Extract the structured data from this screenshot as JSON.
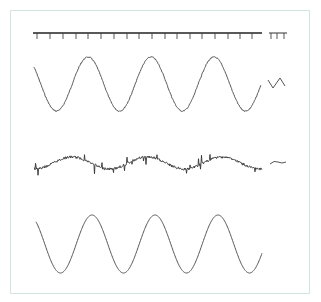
{
  "figure": {
    "border_color": "#cfe6e2",
    "line_color": "#555555",
    "ruler": {
      "y": 33,
      "x_start": 33,
      "x_end": 262,
      "tick_positions": [
        37,
        50,
        63,
        76,
        88,
        101,
        114,
        127,
        139,
        152,
        165,
        177,
        190,
        202,
        215,
        228,
        240,
        252
      ],
      "tick_length": 6,
      "legend_ticks": [
        271,
        277,
        284
      ],
      "legend_x_start": 269,
      "legend_x_end": 287
    },
    "traces": [
      {
        "name": "clean-sine-top",
        "x_start": 34,
        "x_end": 261,
        "center_y": 84,
        "amplitude": 27,
        "period": 63,
        "phase_x": 88,
        "noise": 0.6,
        "legend_glyph": "zigzag"
      },
      {
        "name": "noisy-low-amplitude-sine",
        "x_start": 34,
        "x_end": 262,
        "center_y": 163,
        "amplitude": 6,
        "period": 75,
        "phase_x": 72,
        "noise": 1.2,
        "spikes": true,
        "legend_glyph": "small-wave"
      },
      {
        "name": "clean-sine-bottom",
        "x_start": 36,
        "x_end": 262,
        "center_y": 244,
        "amplitude": 29,
        "period": 63,
        "phase_x": 92,
        "noise": 0,
        "legend_glyph": "none"
      }
    ]
  }
}
